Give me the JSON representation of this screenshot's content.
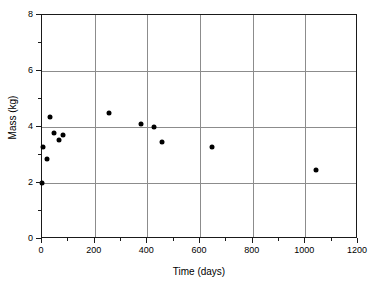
{
  "chart_data": {
    "type": "scatter",
    "title": "",
    "xlabel": "Time (days)",
    "ylabel": "Mass (kg)",
    "xlim": [
      0,
      1200
    ],
    "ylim": [
      0,
      8
    ],
    "xticks": [
      0,
      200,
      400,
      600,
      800,
      1000,
      1200
    ],
    "yticks": [
      0,
      2,
      4,
      6,
      8
    ],
    "xtick_labels": [
      "0",
      "200",
      "400",
      "600",
      "800",
      "1000",
      "1200"
    ],
    "ytick_labels": [
      "0",
      "2",
      "4",
      "6",
      "8"
    ],
    "grid": "horizontal-and-vertical-at-major-ticks",
    "legend": "none",
    "x_minor_tick_interval": 100,
    "y_minor_tick_interval": 1,
    "marker": "filled-circle",
    "marker_color": "#000000",
    "points": [
      {
        "x": 0,
        "y": 2.0
      },
      {
        "x": 5,
        "y": 3.3
      },
      {
        "x": 20,
        "y": 2.85
      },
      {
        "x": 30,
        "y": 4.35
      },
      {
        "x": 45,
        "y": 3.8
      },
      {
        "x": 65,
        "y": 3.55
      },
      {
        "x": 80,
        "y": 3.7
      },
      {
        "x": 255,
        "y": 4.5
      },
      {
        "x": 375,
        "y": 4.1
      },
      {
        "x": 425,
        "y": 4.0
      },
      {
        "x": 455,
        "y": 3.45
      },
      {
        "x": 645,
        "y": 3.3
      },
      {
        "x": 1040,
        "y": 2.45
      }
    ]
  }
}
